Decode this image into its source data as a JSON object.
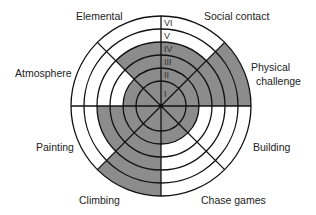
{
  "diagram": {
    "title": "",
    "center": [
      161,
      106
    ],
    "ring_radii": [
      25,
      38,
      51,
      64,
      77,
      90
    ],
    "ring_labels": [
      "I",
      "II",
      "III",
      "IV",
      "V",
      "VI"
    ],
    "fill_color": "#8c8c8c",
    "line_color": "#111111",
    "sectors": [
      {
        "label": "Social contact",
        "start_deg": 0,
        "end_deg": 45,
        "level": 4
      },
      {
        "label": "Physical challenge",
        "start_deg": 45,
        "end_deg": 90,
        "level": 6
      },
      {
        "label": "Building",
        "start_deg": 90,
        "end_deg": 135,
        "level": 2
      },
      {
        "label": "Chase games",
        "start_deg": 135,
        "end_deg": 180,
        "level": 2
      },
      {
        "label": "Climbing",
        "start_deg": 180,
        "end_deg": 225,
        "level": 6
      },
      {
        "label": "Painting",
        "start_deg": 225,
        "end_deg": 270,
        "level": 4
      },
      {
        "label": "Atmosphere",
        "start_deg": 270,
        "end_deg": 315,
        "level": 2
      },
      {
        "label": "Elemental",
        "start_deg": 315,
        "end_deg": 360,
        "level": 4
      }
    ]
  },
  "labels": {
    "elemental": "Elemental",
    "social_contact": "Social contact",
    "physical_line1": "Physical",
    "physical_line2": "challenge",
    "atmosphere": "Atmosphere",
    "building": "Building",
    "painting": "Painting",
    "climbing": "Climbing",
    "chase_games": "Chase games"
  }
}
